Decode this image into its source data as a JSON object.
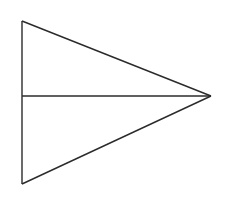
{
  "figure": {
    "canvas": {
      "width": 225,
      "height": 214,
      "background_color": "#ffffff"
    },
    "style": {
      "stroke_color": "#2b2b2b",
      "stroke_width": 1.4,
      "fill_color": "none"
    },
    "vertices": {
      "top_left": {
        "label": "top-left vertex",
        "x": 22,
        "y": 21
      },
      "bottom_left": {
        "label": "bottom-left vertex",
        "x": 22,
        "y": 184
      },
      "right_apex": {
        "label": "right apex vertex",
        "x": 211,
        "y": 96
      },
      "left_midpoint": {
        "label": "left side midpoint",
        "x": 22,
        "y": 96
      }
    },
    "edges": [
      {
        "name": "left-vertical-edge",
        "from": "top_left",
        "to": "bottom_left",
        "points": "22,21 22,184"
      },
      {
        "name": "upper-diagonal-edge",
        "from": "top_left",
        "to": "right_apex",
        "points": "22,21 211,96"
      },
      {
        "name": "lower-diagonal-edge",
        "from": "bottom_left",
        "to": "right_apex",
        "points": "22,184 211,96"
      },
      {
        "name": "horizontal-median-line",
        "from": "left_midpoint",
        "to": "right_apex",
        "points": "22,96 211,96"
      }
    ],
    "triangle_outline_points": "22,21 211,96 22,184"
  },
  "chart_data": {
    "type": "diagram",
    "shape": "triangle",
    "orientation": "apex-right",
    "vertex_coordinates": [
      [
        22,
        21
      ],
      [
        211,
        96
      ],
      [
        22,
        184
      ]
    ],
    "interior_segments": [
      {
        "name": "median",
        "start": [
          22,
          96
        ],
        "end": [
          211,
          96
        ],
        "description": "horizontal line from midpoint of left vertical side to right apex"
      }
    ],
    "labels": [],
    "annotations": [],
    "axis_ranges": {
      "x": [
        0,
        225
      ],
      "y": [
        0,
        214
      ]
    },
    "grid": false,
    "legend": null
  }
}
